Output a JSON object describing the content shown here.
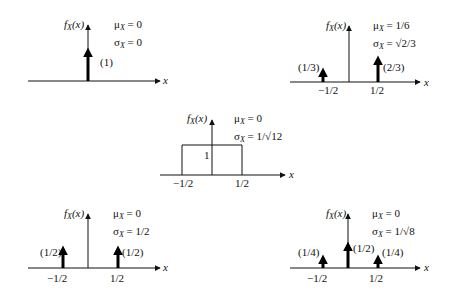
{
  "figure": {
    "ylabel": "f_X(x)",
    "xlabel": "x",
    "panels": [
      {
        "id": "delta-at-zero",
        "axis": {
          "x0": 28,
          "x1": 160,
          "y": 81,
          "vx": 88,
          "vtop": 25
        },
        "ylabel_pos": [
          64,
          28
        ],
        "xlabel_pos": [
          163,
          84
        ],
        "stats": {
          "mu": "μ",
          "mu_val": " = 0",
          "sigma": "σ",
          "sigma_val": " = 0",
          "pos": [
            114,
            28
          ]
        },
        "impulses": [
          {
            "x": 88,
            "top": 51,
            "label": "(1)",
            "lx": 100,
            "ly": 66
          }
        ],
        "ticks": []
      },
      {
        "id": "two-point-asym",
        "axis": {
          "x0": 290,
          "x1": 420,
          "y": 82,
          "vx": 349,
          "vtop": 26
        },
        "ylabel_pos": [
          326,
          29
        ],
        "xlabel_pos": [
          424,
          86
        ],
        "stats": {
          "mu": "μ",
          "mu_val": " = 1/6",
          "sigma": "σ",
          "sigma_val": " = √2/3",
          "pos": [
            373,
            29
          ]
        },
        "impulses": [
          {
            "x": 323,
            "top": 71,
            "label": "(1/3)",
            "lx": 298,
            "ly": 71
          },
          {
            "x": 378,
            "top": 59,
            "label": "(2/3)",
            "lx": 383,
            "ly": 71
          }
        ],
        "ticks": [
          {
            "x": 318,
            "y": 94,
            "label": "−1/2"
          },
          {
            "x": 370,
            "y": 94,
            "label": "1/2"
          }
        ]
      },
      {
        "id": "uniform",
        "axis": {
          "x0": 160,
          "x1": 285,
          "y": 175,
          "vx": 212,
          "vtop": 120
        },
        "ylabel_pos": [
          187,
          122
        ],
        "xlabel_pos": [
          289,
          178
        ],
        "stats": {
          "mu": "μ",
          "mu_val": " = 0",
          "sigma": "σ",
          "sigma_val": " = 1/√12",
          "pos": [
            234,
            122
          ]
        },
        "impulses": [],
        "rect": {
          "x0": 182,
          "x1": 242,
          "top": 145,
          "label": "1",
          "lx": 204,
          "ly": 159
        },
        "ticks": [
          {
            "x": 173,
            "y": 187,
            "label": "−1/2"
          },
          {
            "x": 235,
            "y": 187,
            "label": "1/2"
          }
        ]
      },
      {
        "id": "two-point-sym",
        "axis": {
          "x0": 28,
          "x1": 160,
          "y": 268,
          "vx": 88,
          "vtop": 214
        },
        "ylabel_pos": [
          64,
          217
        ],
        "xlabel_pos": [
          163,
          271
        ],
        "stats": {
          "mu": "μ",
          "mu_val": " = 0",
          "sigma": "σ",
          "sigma_val": " = 1/2",
          "pos": [
            113,
            217
          ]
        },
        "impulses": [
          {
            "x": 63,
            "top": 249,
            "label": "(1/2)",
            "lx": 40,
            "ly": 256
          },
          {
            "x": 118,
            "top": 249,
            "label": "(1/2)",
            "lx": 122,
            "ly": 256
          }
        ],
        "ticks": [
          {
            "x": 47,
            "y": 282,
            "label": "−1/2"
          },
          {
            "x": 110,
            "y": 282,
            "label": "1/2"
          }
        ]
      },
      {
        "id": "three-point",
        "axis": {
          "x0": 290,
          "x1": 420,
          "y": 268,
          "vx": 348,
          "vtop": 214
        },
        "ylabel_pos": [
          326,
          217
        ],
        "xlabel_pos": [
          424,
          271
        ],
        "stats": {
          "mu": "μ",
          "mu_val": " = 0",
          "sigma": "σ",
          "sigma_val": " = 1/√8",
          "pos": [
            372,
            217
          ]
        },
        "impulses": [
          {
            "x": 323,
            "top": 258,
            "label": "(1/4)",
            "lx": 298,
            "ly": 256
          },
          {
            "x": 348,
            "top": 245,
            "label": "(1/2)",
            "lx": 353,
            "ly": 252
          },
          {
            "x": 378,
            "top": 258,
            "label": "(1/4)",
            "lx": 382,
            "ly": 256
          }
        ],
        "ticks": [
          {
            "x": 307,
            "y": 282,
            "label": "−1/2"
          },
          {
            "x": 369,
            "y": 282,
            "label": "1/2"
          }
        ]
      }
    ]
  }
}
